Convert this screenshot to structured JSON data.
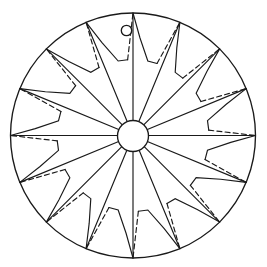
{
  "figure": {
    "kind": "line-drawing",
    "background_color": "#ffffff",
    "stroke_color": "#1a1a1a",
    "canvas": {
      "width": 267,
      "height": 267
    },
    "outer_circle": {
      "name": "outer-rim-circle",
      "center_x": 133,
      "center_y": 135.5,
      "radius": 122.5,
      "stroke_width": 1.35
    },
    "hub_circle": {
      "name": "center-hub-circle",
      "center_x": 133,
      "center_y": 136,
      "radius": 15.5,
      "stroke_width": 1.35
    },
    "suspension_hole": {
      "name": "suspension-hole",
      "center_x": 126.5,
      "center_y": 30.5,
      "radius": 5.2,
      "stroke_width": 1.35
    },
    "spokes": {
      "name": "radial-spokes",
      "count": 16,
      "start_radius": 15.5,
      "end_radius": 122.5,
      "start_angle_deg": -90,
      "step_angle_deg": 22.5,
      "stroke_width": 1.15,
      "style": "solid"
    },
    "zigzag_motifs": {
      "name": "zigzag-step-motifs",
      "count": 16,
      "description": "Between each adjacent pair of spokes a solid stepped notch runs inward from the rim and a dashed chord returns to the neighbouring rim point.",
      "inner_radius_ratio": 0.62,
      "mid_radius_ratio": 0.8,
      "solid_style": "solid",
      "return_style": "dashed",
      "dash_pattern": "5 3.2"
    },
    "legend": {
      "solid_label": "solid construction line",
      "dashed_label": "dashed return line"
    }
  }
}
